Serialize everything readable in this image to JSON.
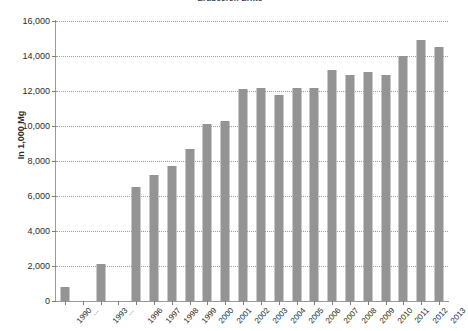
{
  "chart_data": {
    "type": "bar",
    "title": "Erdbeeren Ernte",
    "xlabel": "",
    "ylabel": "In 1,000 Mg",
    "ylim": [
      0,
      16000
    ],
    "ytick_labels": [
      "0",
      "2,000",
      "4,000",
      "6,000",
      "8,000",
      "10,000",
      "12,000",
      "14,000",
      "16,000"
    ],
    "ytick_values": [
      0,
      2000,
      4000,
      6000,
      8000,
      10000,
      12000,
      14000,
      16000
    ],
    "grid": true,
    "legend": "none",
    "bar_color": "#949494",
    "categories": [
      "1990",
      "...",
      "1993",
      "...",
      "1996",
      "1997",
      "1998",
      "1999",
      "2000",
      "2001",
      "2002",
      "2003",
      "2004",
      "2005",
      "2006",
      "2007",
      "2008",
      "2009",
      "2010",
      "2011",
      "2012",
      "2013"
    ],
    "values": [
      800,
      null,
      2100,
      null,
      6500,
      7200,
      7700,
      8700,
      10100,
      10300,
      12100,
      12200,
      11800,
      12200,
      12200,
      13200,
      12900,
      13100,
      12900,
      14000,
      14900,
      14500
    ]
  }
}
